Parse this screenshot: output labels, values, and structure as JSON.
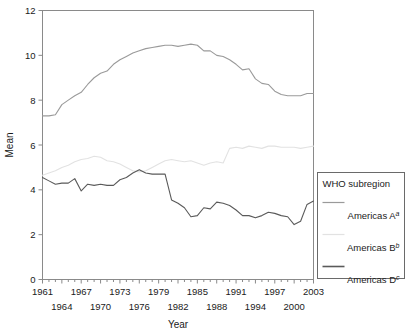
{
  "chart_data": {
    "type": "line",
    "title": "",
    "xlabel": "Year",
    "ylabel": "Mean",
    "xlim": [
      1961,
      2003
    ],
    "ylim": [
      0,
      12
    ],
    "yticks": [
      0,
      2,
      4,
      6,
      8,
      10,
      12
    ],
    "xticks_upper_row": [
      1961,
      1967,
      1973,
      1979,
      1985,
      1991,
      1997,
      2003
    ],
    "xticks_lower_row": [
      1964,
      1970,
      1976,
      1982,
      1988,
      1994,
      2000
    ],
    "grid": false,
    "legend_position": "right-outside",
    "legend_title": "WHO subregion",
    "x": [
      1961,
      1962,
      1963,
      1964,
      1965,
      1966,
      1967,
      1968,
      1969,
      1970,
      1971,
      1972,
      1973,
      1974,
      1975,
      1976,
      1977,
      1978,
      1979,
      1980,
      1981,
      1982,
      1983,
      1984,
      1985,
      1986,
      1987,
      1988,
      1989,
      1990,
      1991,
      1992,
      1993,
      1994,
      1995,
      1996,
      1997,
      1998,
      1999,
      2000,
      2001,
      2002,
      2003
    ],
    "series": [
      {
        "name": "Americas A",
        "superscript": "a",
        "color": "#9a9a9a",
        "values": [
          7.3,
          7.3,
          7.35,
          7.8,
          8.0,
          8.2,
          8.35,
          8.7,
          9.0,
          9.2,
          9.3,
          9.6,
          9.8,
          9.95,
          10.1,
          10.2,
          10.3,
          10.35,
          10.4,
          10.45,
          10.45,
          10.4,
          10.45,
          10.5,
          10.45,
          10.2,
          10.2,
          10.0,
          9.95,
          9.8,
          9.6,
          9.35,
          9.4,
          8.95,
          8.75,
          8.7,
          8.4,
          8.25,
          8.2,
          8.2,
          8.2,
          8.3,
          8.3
        ]
      },
      {
        "name": "Americas B",
        "superscript": "b",
        "color": "#e2e2e2",
        "values": [
          4.65,
          4.75,
          4.85,
          5.0,
          5.1,
          5.25,
          5.35,
          5.4,
          5.5,
          5.45,
          5.3,
          5.25,
          5.15,
          5.0,
          4.85,
          4.8,
          4.85,
          5.0,
          5.15,
          5.3,
          5.35,
          5.3,
          5.25,
          5.3,
          5.2,
          5.1,
          5.2,
          5.25,
          5.2,
          5.85,
          5.9,
          5.85,
          5.95,
          5.9,
          5.85,
          5.95,
          5.95,
          5.9,
          5.9,
          5.9,
          5.85,
          5.9,
          5.95
        ]
      },
      {
        "name": "Americas D",
        "superscript": "c",
        "color": "#5a5a5a",
        "values": [
          4.55,
          4.4,
          4.25,
          4.3,
          4.3,
          4.5,
          3.95,
          4.25,
          4.2,
          4.25,
          4.2,
          4.2,
          4.45,
          4.55,
          4.75,
          4.9,
          4.75,
          4.7,
          4.7,
          4.7,
          3.55,
          3.4,
          3.2,
          2.8,
          2.85,
          3.2,
          3.15,
          3.45,
          3.4,
          3.3,
          3.1,
          2.85,
          2.85,
          2.75,
          2.85,
          3.0,
          2.95,
          2.85,
          2.8,
          2.45,
          2.6,
          3.35,
          3.5
        ]
      }
    ]
  }
}
